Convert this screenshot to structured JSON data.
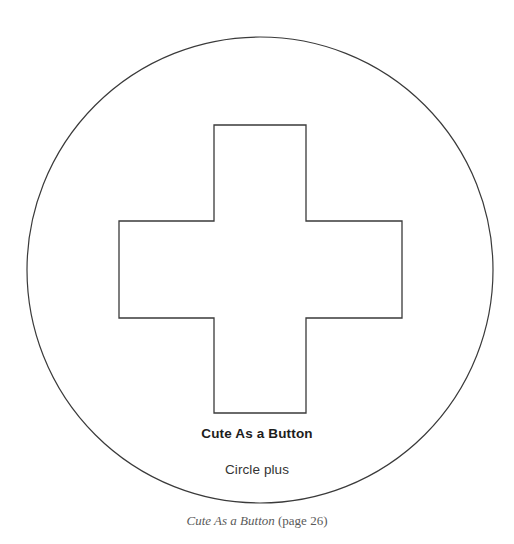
{
  "page": {
    "background_color": "#ffffff",
    "width": 514,
    "height": 544
  },
  "pattern": {
    "title": "Cute As a Button",
    "subtitle": "Circle plus",
    "stroke_color": "#3a3a3a",
    "fill_color": "#ffffff",
    "circle": {
      "name": "circle-outline",
      "cx": 260,
      "cy": 270,
      "r": 233,
      "stroke_width": 1.2
    },
    "plus": {
      "name": "plus-outline",
      "stroke_width": 1.3,
      "left": 119,
      "right": 402,
      "top": 125,
      "bottom": 413,
      "arm_left": 214,
      "arm_right": 306,
      "arm_top": 221,
      "arm_bottom": 318,
      "points": "214,125 306,125 306,221 402,221 402,318 306,318 306,413 214,413 214,318 119,318 119,221 214,221"
    }
  },
  "caption": {
    "book_title": "Cute As a Button",
    "page_reference": "(page 26)",
    "color": "#5a5a5a"
  }
}
